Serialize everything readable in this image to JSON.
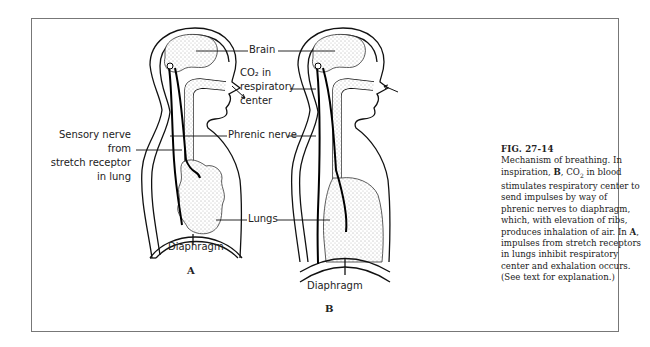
{
  "figure": {
    "number": "FIG. 27-14",
    "caption_parts": [
      "Mechanism of breathing. In inspiration, ",
      "B",
      ", CO",
      "2",
      " in blood stimulates respiratory center to send impulses by way of phrenic nerves to diaphragm, which, with elevation of ribs, produces inhalation of air. In ",
      "A",
      ", impulses from stretch receptors in lungs inhibit respiratory center and exhalation occurs. (See text for explanation.)"
    ]
  },
  "labels": {
    "brain": "Brain",
    "co2_line1": "CO₂ in",
    "co2_line2": "respiratory",
    "co2_line3": "center",
    "sensory_line1": "Sensory nerve",
    "sensory_line2": "from",
    "sensory_line3": "stretch receptor",
    "sensory_line4": "in lung",
    "phrenic": "Phrenic nerve",
    "lungs": "Lungs",
    "diaphragm_a": "Diaphragm",
    "diaphragm_b": "Diaphragm"
  },
  "panels": {
    "a": "A",
    "b": "B"
  }
}
